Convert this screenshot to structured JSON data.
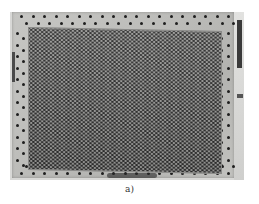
{
  "figure": {
    "caption": "a)",
    "photo": {
      "tone": "grayscale",
      "colors": {
        "frame": "#bdbdba",
        "perforated_area": "#9a9a98",
        "holes": "#2a2a2a",
        "bolt_holes": "#1e1e1e",
        "background": "#ffffff"
      }
    }
  }
}
